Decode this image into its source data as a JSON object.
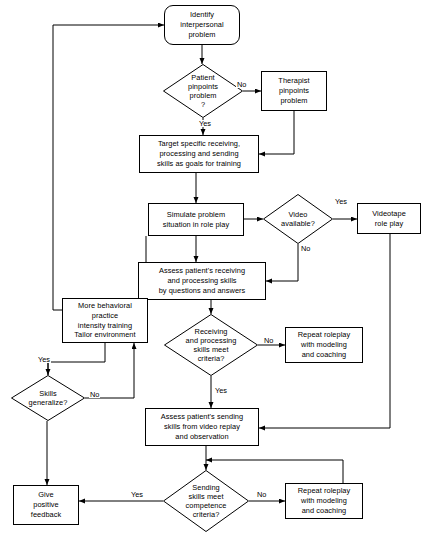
{
  "diagram": {
    "type": "flowchart",
    "width": 429,
    "height": 543,
    "stroke_color": "#000000",
    "background_color": "#ffffff"
  },
  "nodes": [
    {
      "id": "identify-problem",
      "shape": "terminal",
      "text": "Identify\ninterpersonal\nproblem",
      "x": 164,
      "y": 5,
      "w": 76,
      "h": 40
    },
    {
      "id": "patient-pinpoints",
      "shape": "decision",
      "text": "Patient\npinpoints\nproblem\n?",
      "x": 163,
      "y": 64,
      "w": 80,
      "h": 54
    },
    {
      "id": "therapist-pinpoints",
      "shape": "process",
      "text": "Therapist\npinpoints\nproblem",
      "x": 261,
      "y": 71,
      "w": 66,
      "h": 40
    },
    {
      "id": "target-skills",
      "shape": "process",
      "text": "Target specific receiving,\nprocessing and sending\nskills as goals for training",
      "x": 139,
      "y": 135,
      "w": 120,
      "h": 38
    },
    {
      "id": "simulate-problem",
      "shape": "process",
      "text": "Simulate problem\nsituation in role play",
      "x": 148,
      "y": 203,
      "w": 96,
      "h": 33
    },
    {
      "id": "video-available",
      "shape": "decision",
      "text": "Video\navailable?",
      "x": 263,
      "y": 194,
      "w": 70,
      "h": 50
    },
    {
      "id": "videotape-roleplay",
      "shape": "process",
      "text": "Videotape\nrole play",
      "x": 357,
      "y": 203,
      "w": 64,
      "h": 31
    },
    {
      "id": "assess-receiving",
      "shape": "process",
      "text": "Assess patient's receiving\nand processing skills\nby questions and answers",
      "x": 138,
      "y": 262,
      "w": 128,
      "h": 38
    },
    {
      "id": "more-behavioral-practice",
      "shape": "process",
      "text": "More behavioral\npractice\nintensity training\nTailor environment",
      "x": 62,
      "y": 298,
      "w": 86,
      "h": 45
    },
    {
      "id": "receiving-criteria",
      "shape": "decision",
      "text": "Receiving\nand processing\nskills meet\ncriteria?",
      "x": 164,
      "y": 314,
      "w": 94,
      "h": 62
    },
    {
      "id": "repeat-roleplay-middle",
      "shape": "process",
      "text": "Repeat roleplay\nwith modeling\nand coaching",
      "x": 285,
      "y": 327,
      "w": 78,
      "h": 36
    },
    {
      "id": "skills-generalize",
      "shape": "decision",
      "text": "Skills\ngeneralize?",
      "x": 11,
      "y": 375,
      "w": 74,
      "h": 46
    },
    {
      "id": "assess-sending",
      "shape": "process",
      "text": "Assess patient's sending\nskills from video replay\nand observation",
      "x": 145,
      "y": 408,
      "w": 114,
      "h": 38
    },
    {
      "id": "sending-criteria",
      "shape": "decision",
      "text": "Sending\nskills meet\ncompetence\ncriteria?",
      "x": 163,
      "y": 470,
      "w": 86,
      "h": 62
    },
    {
      "id": "give-positive-feedback",
      "shape": "process",
      "text": "Give\npositive\nfeedback",
      "x": 13,
      "y": 485,
      "w": 66,
      "h": 40
    },
    {
      "id": "repeat-roleplay-bottom",
      "shape": "process",
      "text": "Repeat roleplay\nwith modeling\nand coaching",
      "x": 285,
      "y": 483,
      "w": 78,
      "h": 36
    }
  ],
  "edge_labels": [
    {
      "id": "label-no-patient",
      "text": "No",
      "x": 236,
      "y": 81
    },
    {
      "id": "label-yes-patient",
      "text": "Yes",
      "x": 198,
      "y": 120
    },
    {
      "id": "label-yes-video",
      "text": "Yes",
      "x": 334,
      "y": 198
    },
    {
      "id": "label-no-video",
      "text": "No",
      "x": 300,
      "y": 245
    },
    {
      "id": "label-no-receiving",
      "text": "No",
      "x": 263,
      "y": 337
    },
    {
      "id": "label-yes-receiving",
      "text": "Yes",
      "x": 214,
      "y": 387
    },
    {
      "id": "label-yes-generalize",
      "text": "Yes",
      "x": 37,
      "y": 356
    },
    {
      "id": "label-no-generalize",
      "text": "No",
      "x": 89,
      "y": 391
    },
    {
      "id": "label-yes-sending",
      "text": "Yes",
      "x": 130,
      "y": 491
    },
    {
      "id": "label-no-sending",
      "text": "No",
      "x": 256,
      "y": 491
    }
  ]
}
